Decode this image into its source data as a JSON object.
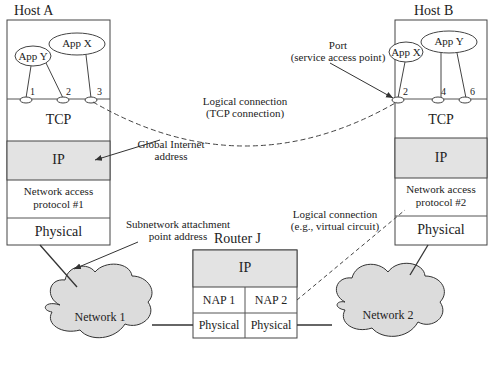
{
  "host_a": {
    "title": "Host A",
    "apps": [
      "App Y",
      "App X"
    ],
    "ports": [
      "1",
      "2",
      "3"
    ],
    "layers": {
      "tcp": "TCP",
      "ip": "IP",
      "nap_line1": "Network access",
      "nap_line2": "protocol #1",
      "physical": "Physical"
    }
  },
  "host_b": {
    "title": "Host B",
    "apps": [
      "App X",
      "App Y"
    ],
    "ports": [
      "2",
      "4",
      "6"
    ],
    "layers": {
      "tcp": "TCP",
      "ip": "IP",
      "nap_line1": "Network access",
      "nap_line2": "protocol #2",
      "physical": "Physical"
    }
  },
  "router": {
    "title": "Router J",
    "ip": "IP",
    "nap1": "NAP 1",
    "nap2": "NAP 2",
    "phys1": "Physical",
    "phys2": "Physical"
  },
  "networks": [
    "Network 1",
    "Network 2"
  ],
  "annotations": {
    "port_line1": "Port",
    "port_line2": "(service access point)",
    "tcp_conn_line1": "Logical connection",
    "tcp_conn_line2": "(TCP connection)",
    "global_line1": "Global Internet",
    "global_line2": "address",
    "subnet_line1": "Subnetwork attachment",
    "subnet_line2": "point address",
    "vc_line1": "Logical connection",
    "vc_line2": "(e.g., virtual circuit)"
  },
  "colors": {
    "shaded": "#e3e3e3",
    "cloud": "#dcdcdc",
    "line": "#333333"
  }
}
